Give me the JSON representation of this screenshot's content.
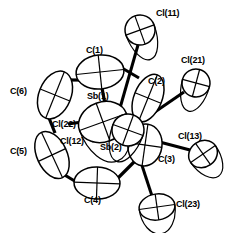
{
  "figure": {
    "type": "ortep-thermal-ellipsoid-diagram",
    "title": "",
    "width": 229,
    "height": 233,
    "background_color": "#ffffff",
    "line_color": "#000000"
  },
  "atoms": [
    {
      "id": "Cl11",
      "label": "Cl(11)",
      "element": "Cl",
      "label_x": 156,
      "label_y": 9,
      "cx": 140,
      "cy": 30,
      "rx": 15,
      "ry": 15,
      "rot": -20,
      "kind": "chlorine"
    },
    {
      "id": "Cl21",
      "label": "Cl(21)",
      "element": "Cl",
      "label_x": 181,
      "label_y": 56,
      "cx": 196,
      "cy": 83,
      "rx": 14,
      "ry": 14,
      "rot": 15,
      "kind": "chlorine"
    },
    {
      "id": "Cl13",
      "label": "Cl(13)",
      "element": "Cl",
      "label_x": 178,
      "label_y": 132,
      "cx": 203,
      "cy": 154,
      "rx": 15,
      "ry": 13,
      "rot": -35,
      "kind": "chlorine"
    },
    {
      "id": "Cl23",
      "label": "Cl(23)",
      "element": "Cl",
      "label_x": 176,
      "label_y": 200,
      "cx": 157,
      "cy": 207,
      "rx": 18,
      "ry": 13,
      "rot": -8,
      "kind": "chlorine"
    },
    {
      "id": "Cl22",
      "label": "Cl(22)",
      "element": "Cl",
      "label_x": 52,
      "label_y": 120,
      "cx": 0,
      "cy": 0,
      "rx": 0,
      "ry": 0,
      "rot": 0,
      "kind": "chlorine-bridge"
    },
    {
      "id": "Cl12",
      "label": "Cl(12)",
      "element": "Cl",
      "label_x": 60,
      "label_y": 137,
      "cx": 0,
      "cy": 0,
      "rx": 0,
      "ry": 0,
      "rot": 0,
      "kind": "chlorine-bridge"
    },
    {
      "id": "C1",
      "label": "C(1)",
      "element": "C",
      "label_x": 86,
      "label_y": 46,
      "cx": 100,
      "cy": 72,
      "rx": 24,
      "ry": 17,
      "rot": -6,
      "kind": "carbon"
    },
    {
      "id": "C2",
      "label": "C(2)",
      "element": "C",
      "label_x": 148,
      "label_y": 77,
      "cx": 148,
      "cy": 98,
      "rx": 14,
      "ry": 25,
      "rot": 22,
      "kind": "carbon"
    },
    {
      "id": "C3",
      "label": "C(3)",
      "element": "C",
      "label_x": 158,
      "label_y": 155,
      "cx": 145,
      "cy": 145,
      "rx": 17,
      "ry": 21,
      "rot": 8,
      "kind": "carbon"
    },
    {
      "id": "C4",
      "label": "C(4)",
      "element": "C",
      "label_x": 84,
      "label_y": 196,
      "cx": 97,
      "cy": 183,
      "rx": 23,
      "ry": 16,
      "rot": 2,
      "kind": "carbon"
    },
    {
      "id": "C5",
      "label": "C(5)",
      "element": "C",
      "label_x": 10,
      "label_y": 147,
      "cx": 52,
      "cy": 155,
      "rx": 15,
      "ry": 25,
      "rot": -25,
      "kind": "carbon"
    },
    {
      "id": "C6",
      "label": "C(6)",
      "element": "C",
      "label_x": 10,
      "label_y": 87,
      "cx": 55,
      "cy": 95,
      "rx": 16,
      "ry": 25,
      "rot": 22,
      "kind": "carbon"
    },
    {
      "id": "Sb1",
      "label": "Sb(1)",
      "element": "Sb",
      "label_x": 87,
      "label_y": 92,
      "cx": 103,
      "cy": 122,
      "rx": 25,
      "ry": 20,
      "rot": -20,
      "kind": "antimony"
    },
    {
      "id": "Sb2",
      "label": "Sb(2)",
      "element": "Sb",
      "label_x": 100,
      "label_y": 143,
      "cx": 128,
      "cy": 130,
      "rx": 16,
      "ry": 16,
      "rot": 20,
      "kind": "antimony"
    }
  ],
  "bonds": [
    {
      "from": "Cl11",
      "to": "Sb1",
      "x1": 138,
      "y1": 45,
      "x2": 120,
      "y2": 108,
      "width": 3.0
    },
    {
      "from": "Cl21",
      "to": "Sb2",
      "x1": 184,
      "y1": 92,
      "x2": 133,
      "y2": 127,
      "width": 3.0
    },
    {
      "from": "Cl13",
      "to": "C3",
      "x1": 190,
      "y1": 150,
      "x2": 152,
      "y2": 140,
      "width": 3.2
    },
    {
      "from": "Cl23",
      "to": "Sb2",
      "x1": 152,
      "y1": 196,
      "x2": 133,
      "y2": 138,
      "width": 3.0
    },
    {
      "from": "C1",
      "to": "Sb1",
      "x1": 102,
      "y1": 88,
      "x2": 105,
      "y2": 104,
      "width": 3.2
    },
    {
      "from": "C1",
      "to": "C6",
      "x1": 80,
      "y1": 80,
      "x2": 66,
      "y2": 80,
      "width": 3.2
    },
    {
      "from": "C6",
      "to": "C5",
      "x1": 49,
      "y1": 118,
      "x2": 55,
      "y2": 133,
      "width": 3.2
    },
    {
      "from": "C5",
      "to": "C4",
      "x1": 63,
      "y1": 174,
      "x2": 78,
      "y2": 183,
      "width": 3.2
    },
    {
      "from": "C4",
      "to": "C3",
      "x1": 118,
      "y1": 178,
      "x2": 135,
      "y2": 161,
      "width": 3.2
    },
    {
      "from": "C2",
      "to": "C1",
      "x1": 139,
      "y1": 78,
      "x2": 122,
      "y2": 68,
      "width": 3.0
    },
    {
      "from": "C2",
      "to": "Sb2",
      "x1": 142,
      "y1": 118,
      "x2": 133,
      "y2": 133,
      "width": 3.0
    },
    {
      "from": "Sb1",
      "to": "Sb2",
      "x1": 118,
      "y1": 126,
      "x2": 126,
      "y2": 128,
      "width": 3.0
    },
    {
      "from": "Sb1",
      "to": "Cl22",
      "x1": 82,
      "y1": 122,
      "x2": 68,
      "y2": 124,
      "width": 3.2
    },
    {
      "from": "Sb2",
      "to": "Cl12",
      "x1": 118,
      "y1": 136,
      "x2": 92,
      "y2": 141,
      "width": 3.2
    }
  ]
}
